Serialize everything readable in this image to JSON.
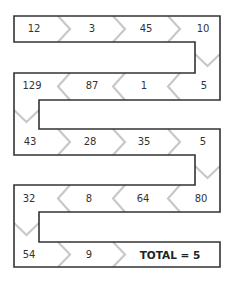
{
  "puzzle": {
    "rows": [
      {
        "direction": "right",
        "cells": [
          "12",
          "3",
          "45",
          "10"
        ]
      },
      {
        "direction": "left",
        "cells": [
          "129",
          "87",
          "1",
          "5"
        ]
      },
      {
        "direction": "right",
        "cells": [
          "43",
          "28",
          "35",
          "5"
        ]
      },
      {
        "direction": "left",
        "cells": [
          "32",
          "8",
          "64",
          "80"
        ]
      },
      {
        "direction": "right",
        "cells": [
          "54",
          "9"
        ]
      }
    ],
    "total_label": "TOTAL = 5"
  },
  "colors": {
    "border": "#333333",
    "chevron": "#c8c8c8",
    "text": "#333333"
  }
}
